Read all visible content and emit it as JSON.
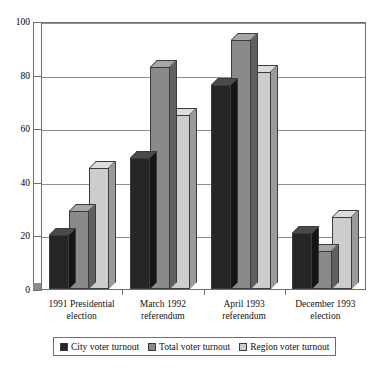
{
  "chart_data": {
    "type": "bar",
    "title": "",
    "subtitle": "",
    "xlabel": "",
    "ylabel": "",
    "ylim": [
      0,
      100
    ],
    "yticks": [
      0,
      20,
      40,
      60,
      80,
      100
    ],
    "grid": true,
    "legend_position": "bottom",
    "style": "3d-clustered-column",
    "categories": [
      "1991 Presidential election",
      "March 1992 referendum",
      "April 1993 referendum",
      "December 1993 election"
    ],
    "category_lines": [
      [
        "1991 Presidential",
        "election"
      ],
      [
        "March 1992",
        "referendum"
      ],
      [
        "April 1993",
        "referendum"
      ],
      [
        "December 1993",
        "election"
      ]
    ],
    "series": [
      {
        "name": "City voter turnout",
        "color": "#262626",
        "values": [
          20,
          49,
          76,
          21
        ]
      },
      {
        "name": "Total voter turnout",
        "color": "#8a8a8a",
        "values": [
          29,
          83,
          93,
          14
        ]
      },
      {
        "name": "Region voter turnout",
        "color": "#cdcdcd",
        "values": [
          45,
          65,
          81,
          27
        ]
      }
    ]
  },
  "axis": {
    "tick_labels": [
      "100",
      "80",
      "60",
      "40",
      "20",
      "0"
    ]
  },
  "legend": {
    "items": [
      {
        "label": "City voter turnout",
        "color": "#262626"
      },
      {
        "label": "Total voter turnout",
        "color": "#8a8a8a"
      },
      {
        "label": "Region voter turnout",
        "color": "#cdcdcd"
      }
    ]
  }
}
